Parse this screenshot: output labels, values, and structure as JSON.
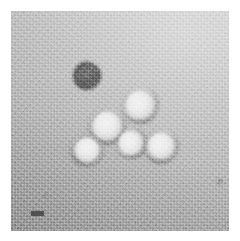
{
  "image": {
    "kind": "transmission-electron-micrograph",
    "technique": "negative stain",
    "plate_background_color": "#b6b6b6",
    "border_color": "#ffffff",
    "width": 240,
    "height": 241,
    "plate": {
      "left": 11,
      "top": 11,
      "width": 218,
      "height": 220
    }
  },
  "scale_bar": {
    "label": "100 nm",
    "visible_text": "",
    "color": "#3c3c3c",
    "left": 31,
    "top": 211,
    "width": 13,
    "height": 5
  },
  "particles": [
    {
      "name": "capsid-top-right",
      "cx": 140,
      "cy": 105,
      "rx": 19,
      "ry": 19,
      "appearance": "bright hexagonal capsid with dark stained rim",
      "rotation": -8
    },
    {
      "name": "capsid-left",
      "cx": 107,
      "cy": 126,
      "rx": 19,
      "ry": 19,
      "appearance": "bright hexagonal capsid with dark stained rim",
      "rotation": 14
    },
    {
      "name": "capsid-bottom-left",
      "cx": 87,
      "cy": 150,
      "rx": 17,
      "ry": 17,
      "appearance": "bright hexagonal capsid with dark stained rim",
      "rotation": 32
    },
    {
      "name": "capsid-center",
      "cx": 131,
      "cy": 143,
      "rx": 16,
      "ry": 16,
      "appearance": "bright hexagonal capsid with dark stained rim",
      "rotation": -22
    },
    {
      "name": "capsid-right",
      "cx": 161,
      "cy": 146,
      "rx": 18,
      "ry": 18,
      "appearance": "bright hexagonal capsid with dark stained rim",
      "rotation": 6
    },
    {
      "name": "capsid-broken",
      "cx": 87,
      "cy": 76,
      "rx": 14,
      "ry": 14,
      "appearance": "dark stain-penetrated broken or empty capsid",
      "rotation": 18
    }
  ],
  "specks": [
    {
      "name": "debris-speck-right",
      "cx": 220,
      "cy": 182,
      "r": 4
    },
    {
      "name": "debris-speck-lower-left",
      "cx": 46,
      "cy": 196,
      "r": 3
    }
  ],
  "counts": {
    "intact_particles": 5,
    "broken_particles": 1
  }
}
